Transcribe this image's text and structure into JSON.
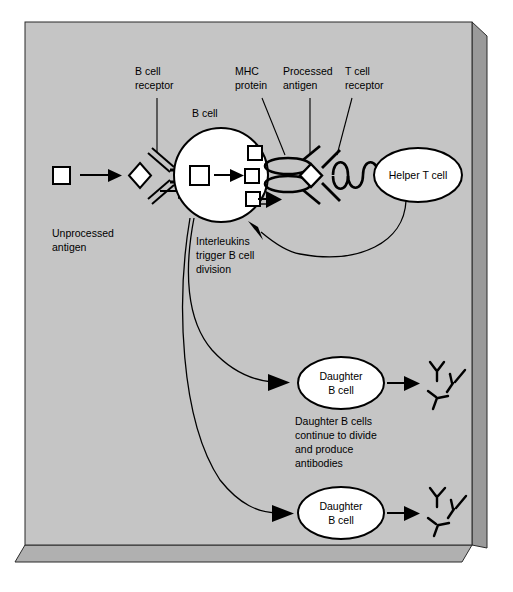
{
  "figure": {
    "panel_color": "#c3c3c3",
    "panel_side_color": "#9a9a9a",
    "panel_bottom_color": "#b0b0b0",
    "cell_fill": "#ffffff",
    "line_color": "#000000"
  },
  "labels": {
    "b_cell_receptor": "B cell\nreceptor",
    "b_cell_receptor_l1": "B cell",
    "b_cell_receptor_l2": "receptor",
    "mhc_protein_l1": "MHC",
    "mhc_protein_l2": "protein",
    "processed_antigen_l1": "Processed",
    "processed_antigen_l2": "antigen",
    "t_cell_receptor_l1": "T cell",
    "t_cell_receptor_l2": "receptor",
    "b_cell": "B cell",
    "helper_t_cell": "Helper T cell",
    "unprocessed_antigen_l1": "Unprocessed",
    "unprocessed_antigen_l2": "antigen",
    "interleukins_l1": "Interleukins",
    "interleukins_l2": "trigger B cell",
    "interleukins_l3": "division",
    "daughter_b_cell_top_l1": "Daughter",
    "daughter_b_cell_top_l2": "B cell",
    "daughter_b_cell_bottom_l1": "Daughter",
    "daughter_b_cell_bottom_l2": "B cell",
    "daughter_note_l1": "Daughter B cells",
    "daughter_note_l2": "continue to divide",
    "daughter_note_l3": "and produce",
    "daughter_note_l4": "antibodies"
  },
  "icons": {
    "unprocessed_antigen": "square-icon",
    "processed_antigen": "diamond-icon",
    "b_cell_receptor": "y-receptor-icon",
    "t_cell_receptor": "coil-icon",
    "mhc_protein": "double-ellipse-icon",
    "antibody": "y-antibody-icon",
    "arrow": "arrow-icon"
  }
}
